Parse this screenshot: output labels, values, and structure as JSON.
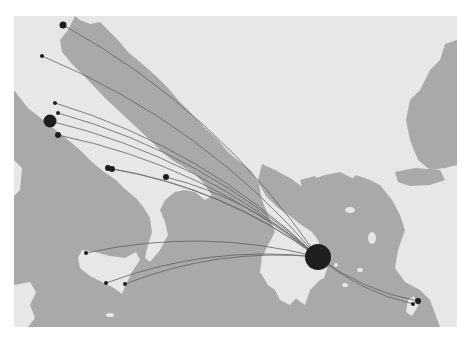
{
  "map": {
    "frame": {
      "x": 14,
      "y": 16,
      "width": 443,
      "height": 311
    },
    "colors": {
      "sea": "#a9a9a9",
      "land": "#e7e7e7",
      "land_shade": "#d6d6d6",
      "node": "#1e1e1e",
      "flow": "#5e5e5e"
    },
    "hub": {
      "name": "hub",
      "x": 318,
      "y": 257,
      "r": 13
    },
    "nodes": [
      {
        "x": 63,
        "y": 25,
        "r": 3.5
      },
      {
        "x": 42,
        "y": 56,
        "r": 2
      },
      {
        "x": 55,
        "y": 103,
        "r": 2
      },
      {
        "x": 58,
        "y": 113,
        "r": 2
      },
      {
        "x": 50,
        "y": 121,
        "r": 6.5
      },
      {
        "x": 58,
        "y": 135,
        "r": 3
      },
      {
        "x": 108,
        "y": 168,
        "r": 3
      },
      {
        "x": 112,
        "y": 169,
        "r": 3
      },
      {
        "x": 166,
        "y": 177,
        "r": 3
      },
      {
        "x": 86,
        "y": 253,
        "r": 2
      },
      {
        "x": 106,
        "y": 283,
        "r": 2
      },
      {
        "x": 125,
        "y": 284,
        "r": 2
      },
      {
        "x": 413,
        "y": 304,
        "r": 2
      },
      {
        "x": 418,
        "y": 301,
        "r": 3
      }
    ]
  }
}
